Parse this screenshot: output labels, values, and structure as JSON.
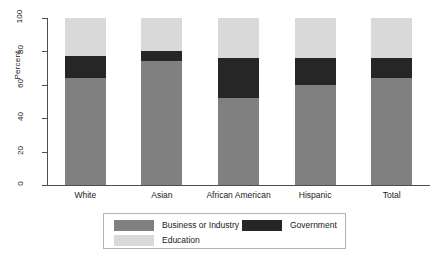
{
  "chart_data": {
    "type": "bar",
    "title": "",
    "subtitle": "",
    "xlabel": "",
    "ylabel": "Percent",
    "ylim": [
      0,
      100
    ],
    "yticks": [
      0,
      20,
      40,
      60,
      80,
      100
    ],
    "grid": false,
    "stacked": true,
    "legend_position": "bottom",
    "categories": [
      "White",
      "Asian",
      "African American",
      "Hispanic",
      "Total"
    ],
    "series": [
      {
        "name": "Business or Industry",
        "color": "#808080",
        "values": [
          64,
          74,
          52,
          60,
          64
        ]
      },
      {
        "name": "Government",
        "color": "#262626",
        "values": [
          13,
          6,
          24,
          16,
          12
        ]
      },
      {
        "name": "Education",
        "color": "#d9d9d9",
        "values": [
          23,
          20,
          24,
          24,
          24
        ]
      }
    ]
  },
  "axes": {
    "y_title": "Percent",
    "y_tick_labels": [
      "0",
      "20",
      "40",
      "60",
      "80",
      "100"
    ],
    "x_tick_labels": [
      "White",
      "Asian",
      "African American",
      "Hispanic",
      "Total"
    ]
  },
  "legend": {
    "entries": [
      {
        "label": "Business or Industry",
        "color": "#808080"
      },
      {
        "label": "Government",
        "color": "#262626"
      },
      {
        "label": "Education",
        "color": "#d9d9d9"
      }
    ]
  },
  "colors": {
    "business": "#808080",
    "government": "#262626",
    "education": "#d9d9d9",
    "axis": "#4d4d4d",
    "legend_border": "#b3b3b3",
    "background": "#ffffff"
  }
}
